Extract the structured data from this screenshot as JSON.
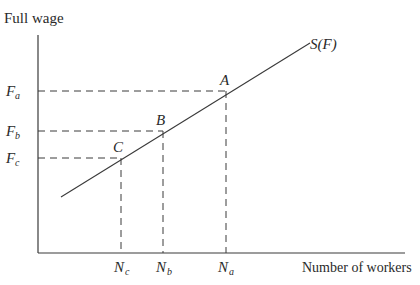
{
  "diagram": {
    "type": "supply-curve",
    "y_axis_label": "Full wage",
    "x_axis_label": "Number of workers",
    "curve_label": "S(F)",
    "points": [
      {
        "name": "A",
        "x_label": "N",
        "x_sub": "a",
        "y_label": "F",
        "y_sub": "a"
      },
      {
        "name": "B",
        "x_label": "N",
        "x_sub": "b",
        "y_label": "F",
        "y_sub": "b"
      },
      {
        "name": "C",
        "x_label": "N",
        "x_sub": "c",
        "y_label": "F",
        "y_sub": "c"
      }
    ]
  },
  "colors": {
    "line": "#3a3a3a",
    "background": "#ffffff"
  }
}
